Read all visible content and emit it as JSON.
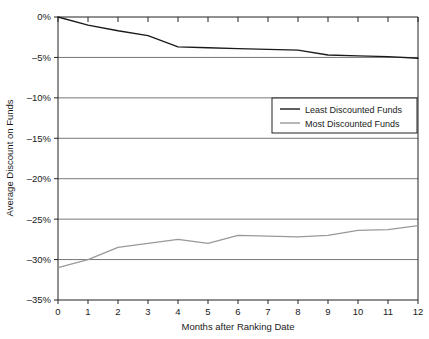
{
  "chart_data": {
    "type": "line",
    "title": "",
    "xlabel": "Months after Ranking Date",
    "ylabel": "Average Discount on Funds",
    "x": [
      0,
      1,
      2,
      3,
      4,
      5,
      6,
      7,
      8,
      9,
      10,
      11,
      12
    ],
    "xtick_labels": [
      "0",
      "1",
      "2",
      "3",
      "4",
      "5",
      "6",
      "7",
      "8",
      "9",
      "10",
      "11",
      "12"
    ],
    "ytick_labels": [
      "0%",
      "–5%",
      "–10%",
      "–15%",
      "–20%",
      "–25%",
      "–30%",
      "–35%"
    ],
    "ytick_values": [
      0,
      -5,
      -10,
      -15,
      -20,
      -25,
      -30,
      -35
    ],
    "xlim": [
      0,
      12
    ],
    "ylim": [
      -35,
      0
    ],
    "grid": "horizontal",
    "legend_position": "upper-right-inside",
    "series": [
      {
        "name": "Least Discounted Funds",
        "color": "#1a1a1a",
        "values": [
          0.0,
          -1.0,
          -1.7,
          -2.3,
          -3.7,
          -3.8,
          -3.9,
          -4.0,
          -4.1,
          -4.7,
          -4.8,
          -4.9,
          -5.1
        ]
      },
      {
        "name": "Most Discounted Funds",
        "color": "#999999",
        "values": [
          -31.0,
          -30.0,
          -28.5,
          -28.0,
          -27.5,
          -28.0,
          -27.0,
          -27.1,
          -27.2,
          -27.0,
          -26.4,
          -26.3,
          -25.8
        ]
      }
    ]
  },
  "legend": {
    "entries": [
      {
        "label": "Least Discounted Funds"
      },
      {
        "label": "Most Discounted Funds"
      }
    ]
  }
}
